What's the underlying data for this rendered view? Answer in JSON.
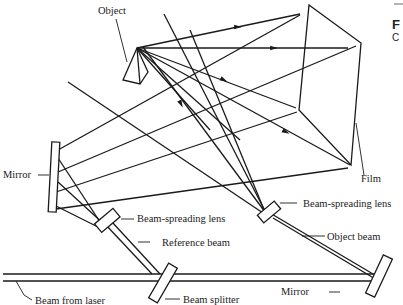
{
  "figure": {
    "labels": {
      "object": "Object",
      "film": "Film",
      "mirror_left": "Mirror",
      "beam_spreading_lens_ref": "Beam-spreading lens",
      "reference_beam": "Reference beam",
      "beam_spreading_lens_obj": "Beam-spreading lens",
      "object_beam": "Object beam",
      "mirror_right": "Mirror",
      "beam_from_laser": "Beam from laser",
      "beam_splitter": "Beam splitter"
    },
    "side_caption": {
      "letter_bold": "F",
      "letter_small": "C"
    }
  }
}
